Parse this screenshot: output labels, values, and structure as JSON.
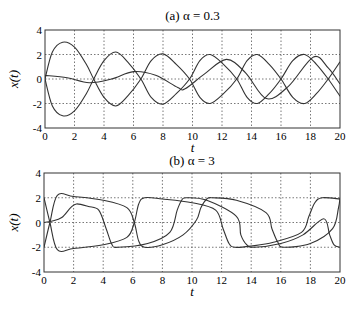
{
  "chart_data": [
    {
      "type": "line",
      "title": "(a) α = 0.3",
      "xlabel": "t",
      "ylabel": "x(t)",
      "xlim": [
        0,
        20
      ],
      "ylim": [
        -4,
        4
      ],
      "xticks": [
        0,
        2,
        4,
        6,
        8,
        10,
        12,
        14,
        16,
        18,
        20
      ],
      "yticks": [
        4,
        2,
        0,
        -2,
        -4
      ],
      "grid": true,
      "series": [
        {
          "name": "trajectory 1",
          "x": [
            0,
            0.5,
            1.2,
            2,
            2.8,
            3.3,
            4,
            4.8,
            5.6,
            6.5,
            7.2,
            8,
            8.9,
            9.8,
            10.5,
            11.2,
            12.1,
            13,
            13.7,
            14.4,
            15.2,
            16,
            16.8,
            17.6,
            18.4,
            19.2,
            20
          ],
          "y": [
            0,
            2.2,
            3,
            2.6,
            1.2,
            0,
            -1.5,
            -2.2,
            -1.4,
            0,
            1.5,
            2.05,
            1.2,
            0,
            -1.5,
            -2,
            -1.2,
            0,
            1.5,
            2,
            1.2,
            0,
            -1.5,
            -2,
            -1.2,
            0,
            1.4
          ]
        },
        {
          "name": "trajectory 2",
          "x": [
            0,
            0.5,
            1.2,
            2,
            2.8,
            3.3,
            4,
            4.8,
            5.6,
            6.5,
            7.2,
            8,
            8.9,
            9.8,
            10.5,
            11.2,
            12.1,
            13,
            13.7,
            14.4,
            15.2,
            16,
            16.8,
            17.6,
            18.4,
            19.2,
            20
          ],
          "y": [
            0,
            -2.2,
            -3,
            -2.6,
            -1.2,
            0,
            1.5,
            2.2,
            1.4,
            0,
            -1.5,
            -2.05,
            -1.2,
            0,
            1.5,
            2,
            1.2,
            0,
            -1.5,
            -2,
            -1.2,
            0,
            1.5,
            2,
            1.2,
            0,
            -1.4
          ]
        },
        {
          "name": "trajectory 3",
          "x": [
            0,
            1.5,
            3,
            4.5,
            6,
            7.5,
            9,
            9.5,
            10.8,
            12.3,
            13.6,
            15,
            16.5,
            18.2,
            19.2,
            20
          ],
          "y": [
            0.3,
            0.1,
            -0.3,
            0,
            0.6,
            0.3,
            -0.7,
            -0.8,
            0.4,
            1.6,
            0.5,
            -1.6,
            -0.6,
            1.8,
            0.9,
            -0.4
          ]
        }
      ]
    },
    {
      "type": "line",
      "title": "(b) α = 3",
      "xlabel": "t",
      "ylabel": "x(t)",
      "xlim": [
        0,
        20
      ],
      "ylim": [
        -4,
        4
      ],
      "xticks": [
        0,
        2,
        4,
        6,
        8,
        10,
        12,
        14,
        16,
        18,
        20
      ],
      "yticks": [
        4,
        2,
        0,
        -2,
        -4
      ],
      "grid": true,
      "series": [
        {
          "name": "trajectory 1",
          "x": [
            0,
            0.4,
            0.9,
            2,
            4,
            5.6,
            6.1,
            6.4,
            6.8,
            8,
            10,
            11.6,
            12.1,
            12.5,
            12.9,
            14,
            15.5,
            17.4,
            17.9,
            18.3,
            18.8,
            20
          ],
          "y": [
            2,
            0,
            -2.2,
            -2.1,
            -1.8,
            -1.2,
            0,
            1.5,
            2,
            1.9,
            1.6,
            1,
            -0.5,
            -1.7,
            -2,
            -1.9,
            -1.6,
            -0.8,
            0.5,
            1.6,
            2,
            1.9
          ]
        },
        {
          "name": "trajectory 2",
          "x": [
            0,
            0.4,
            0.9,
            2,
            4,
            5.6,
            6.1,
            6.4,
            6.8,
            8,
            9.4,
            10.3,
            10.6,
            11,
            11.4,
            13,
            15,
            15.4,
            15.8,
            16.2,
            18,
            19.5,
            19.9,
            20
          ],
          "y": [
            -2,
            0,
            2.2,
            2.1,
            1.8,
            1.2,
            0,
            -1.5,
            -2,
            -1.8,
            -1,
            0.2,
            1.2,
            1.9,
            2,
            1.8,
            0.8,
            -0.5,
            -1.6,
            -2,
            -1.7,
            -0.5,
            1.2,
            2
          ]
        },
        {
          "name": "trajectory 3",
          "x": [
            0,
            0.5,
            1.2,
            1.8,
            2.2,
            3,
            3.7,
            4.2,
            4.6,
            5,
            7,
            8.5,
            9,
            9.3,
            9.6,
            11,
            13,
            13.3,
            13.7,
            14.2,
            16,
            17.5,
            18.9,
            19.3,
            19.6,
            20
          ],
          "y": [
            0,
            0.1,
            0.4,
            1.2,
            1.5,
            1.3,
            1,
            -0.5,
            -1.8,
            -2,
            -1.7,
            -0.8,
            1,
            1.8,
            2,
            1.8,
            0.5,
            -1,
            -1.8,
            -2,
            -1.7,
            -1,
            0.3,
            -1,
            -1.8,
            -2
          ]
        }
      ]
    }
  ],
  "panels": {
    "a": {
      "title": "(a) α = 0.3",
      "xlabel": "t",
      "ylabel": "x(t)"
    },
    "b": {
      "title": "(b) α = 3",
      "xlabel": "t",
      "ylabel": "x(t)"
    }
  }
}
